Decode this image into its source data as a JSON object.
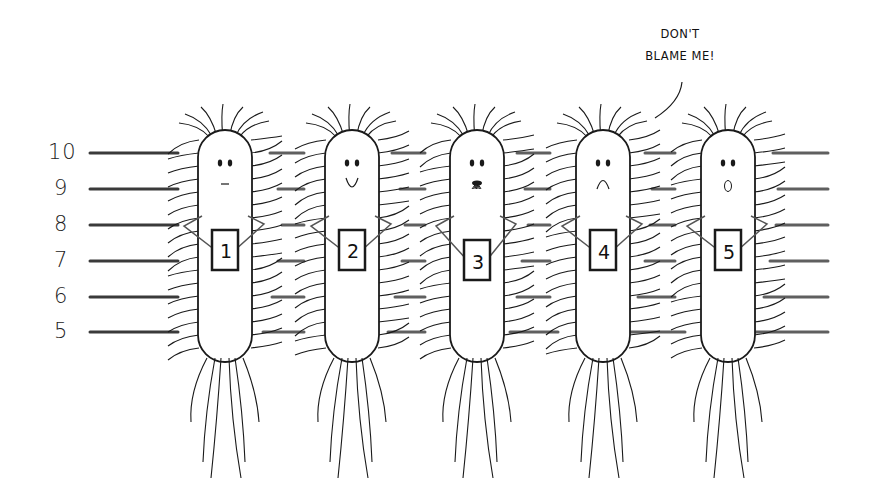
{
  "scale": {
    "labels": [
      "10",
      "9",
      "8",
      "7",
      "6",
      "5"
    ],
    "y_positions": [
      153,
      189,
      225,
      261,
      297,
      332
    ]
  },
  "speech_bubble": {
    "line1": "DON'T",
    "line2": "BLAME ME!",
    "speaker": "organism-4"
  },
  "organisms": [
    {
      "number": "1",
      "face": "neutral",
      "center_x": 225
    },
    {
      "number": "2",
      "face": "smile",
      "center_x": 352
    },
    {
      "number": "3",
      "face": "mustache",
      "center_x": 477
    },
    {
      "number": "4",
      "face": "frown",
      "center_x": 603
    },
    {
      "number": "5",
      "face": "surprised",
      "center_x": 728
    }
  ],
  "colors": {
    "ink": "#1a1a1a",
    "line": "#333333",
    "background": "#ffffff"
  }
}
